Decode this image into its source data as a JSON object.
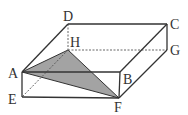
{
  "figure": {
    "type": "rectangular-prism",
    "colors": {
      "edge": "#333333",
      "shade": "#a3a3a3",
      "background": "#ffffff"
    },
    "vertices": {
      "A": [
        22,
        72
      ],
      "B": [
        120,
        72
      ],
      "C": [
        167,
        24
      ],
      "D": [
        68,
        24
      ],
      "E": [
        22,
        97
      ],
      "F": [
        119,
        98
      ],
      "G": [
        167,
        50
      ],
      "H": [
        68,
        50
      ]
    },
    "labels": [
      {
        "id": "D",
        "text": "D",
        "x": 63,
        "y": 21
      },
      {
        "id": "C",
        "text": "C",
        "x": 170,
        "y": 29
      },
      {
        "id": "H",
        "text": "H",
        "x": 70,
        "y": 47
      },
      {
        "id": "G",
        "text": "G",
        "x": 170,
        "y": 55
      },
      {
        "id": "A",
        "text": "A",
        "x": 8,
        "y": 78
      },
      {
        "id": "B",
        "text": "B",
        "x": 123,
        "y": 84
      },
      {
        "id": "E",
        "text": "E",
        "x": 8,
        "y": 104
      },
      {
        "id": "F",
        "text": "F",
        "x": 114,
        "y": 112
      }
    ],
    "visible_edges": [
      "AB",
      "BC",
      "CD",
      "DA",
      "AE",
      "EF",
      "FB",
      "CG",
      "GF"
    ],
    "hidden_edges": [
      "DH",
      "HG",
      "HE"
    ],
    "shaded_polygon": [
      "A",
      "F",
      "H"
    ]
  }
}
